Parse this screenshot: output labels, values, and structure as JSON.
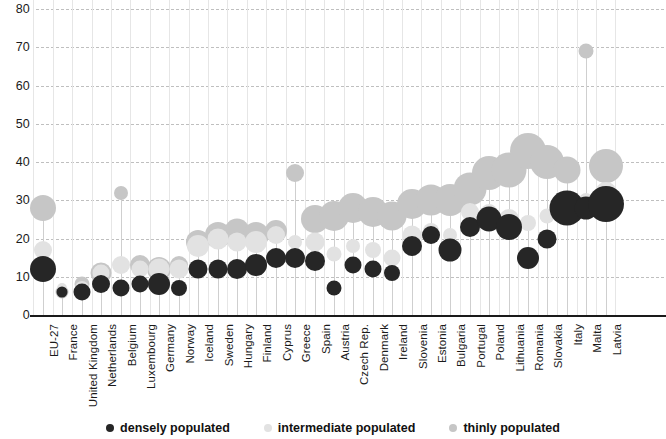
{
  "chart_data": {
    "type": "scatter",
    "title": "",
    "subtitle": "",
    "xlabel": "",
    "ylabel": "",
    "ylim": [
      0,
      80
    ],
    "y_ticks": [
      0,
      10,
      20,
      30,
      40,
      50,
      60,
      70,
      80
    ],
    "grid": true,
    "legend_position": "bottom-center",
    "bubble_note": "Marker area encodes relative share; vertical position encodes the plotted value.",
    "categories": [
      "EU-27",
      "France",
      "United Kingdom",
      "Netherlands",
      "Belgium",
      "Luxembourg",
      "Germany",
      "Norway",
      "Iceland",
      "Sweden",
      "Hungary",
      "Finland",
      "Cyprus",
      "Greece",
      "Spain",
      "Austria",
      "Czech Rep.",
      "Denmark",
      "Ireland",
      "Slovenia",
      "Estonia",
      "Bulgaria",
      "Portugal",
      "Poland",
      "Lithuania",
      "Romania",
      "Slovakia",
      "Italy",
      "Malta",
      "Latvia"
    ],
    "series": [
      {
        "name": "densely populated",
        "color": "#262626",
        "values": [
          12,
          6,
          6,
          8,
          7,
          8,
          8,
          7,
          12,
          12,
          12,
          13,
          15,
          15,
          14,
          7,
          13,
          12,
          11,
          18,
          21,
          17,
          23,
          25,
          23,
          15,
          20,
          28,
          28,
          29
        ],
        "sizes": [
          26,
          11,
          17,
          18,
          17,
          17,
          22,
          16,
          19,
          19,
          20,
          22,
          20,
          20,
          20,
          15,
          17,
          17,
          16,
          20,
          18,
          23,
          20,
          25,
          26,
          22,
          19,
          35,
          23,
          36
        ]
      },
      {
        "name": "intermediate populated",
        "color": "#e2e2e2",
        "values": [
          17,
          7,
          7,
          11,
          13,
          12,
          12,
          12,
          18,
          20,
          19,
          19,
          21,
          19,
          19,
          16,
          18,
          17,
          15,
          21,
          22,
          21,
          27,
          27,
          25,
          24,
          26,
          29,
          30,
          32
        ],
        "sizes": [
          18,
          10,
          14,
          17,
          18,
          17,
          21,
          19,
          22,
          21,
          19,
          22,
          18,
          14,
          19,
          15,
          14,
          16,
          17,
          19,
          16,
          14,
          18,
          16,
          20,
          16,
          15,
          18,
          14,
          22
        ]
      },
      {
        "name": "thinly populated",
        "color": "#c6c6c6",
        "values": [
          28,
          6,
          8,
          11,
          32,
          13,
          12,
          13,
          19,
          21,
          22,
          21,
          22,
          37,
          25,
          26,
          28,
          27,
          26,
          29,
          30,
          30,
          33,
          37,
          38,
          43,
          40,
          38,
          69,
          39
        ],
        "sizes": [
          26,
          13,
          15,
          21,
          14,
          20,
          24,
          18,
          24,
          26,
          25,
          26,
          22,
          18,
          28,
          30,
          30,
          30,
          29,
          30,
          31,
          32,
          33,
          34,
          35,
          36,
          34,
          27,
          15,
          34
        ]
      }
    ]
  },
  "legend": {
    "items": [
      {
        "label": "densely populated",
        "key": "densely"
      },
      {
        "label": "intermediate populated",
        "key": "intermediate"
      },
      {
        "label": "thinly populated",
        "key": "thinly"
      }
    ]
  },
  "colors": {
    "densely": "#262626",
    "intermediate": "#e2e2e2",
    "thinly": "#c6c6c6",
    "gridline": "#bfbfbf",
    "axis": "#1a1a1a",
    "background": "#ffffff"
  }
}
